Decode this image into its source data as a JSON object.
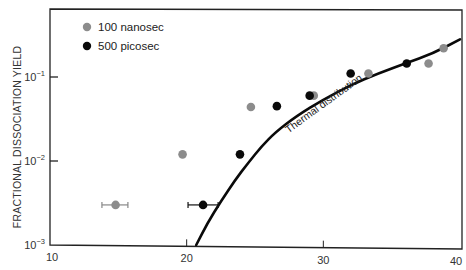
{
  "chart_data": {
    "type": "scatter",
    "title": "",
    "xlabel": "",
    "ylabel": "FRACTIONAL DISSOCIATION YIELD",
    "xlim": [
      10,
      40
    ],
    "ylim": [
      0.001,
      0.3
    ],
    "yscale": "log",
    "grid": false,
    "legend_position": "upper left",
    "x_ticks": [
      10,
      20,
      30,
      40
    ],
    "x_tick_labels": [
      "10",
      "20",
      "30",
      "40"
    ],
    "y_ticks": [
      0.001,
      0.01,
      0.1
    ],
    "y_tick_labels": [
      {
        "base": "10",
        "exp": "−3"
      },
      {
        "base": "10",
        "exp": "−2"
      },
      {
        "base": "10",
        "exp": "−1"
      }
    ],
    "series": [
      {
        "name": "100 nanosec",
        "color": "#8c8c8c",
        "marker": "circle",
        "points": [
          {
            "x": 14.8,
            "y": 0.003,
            "xerr": [
              13.8,
              15.7
            ]
          },
          {
            "x": 19.7,
            "y": 0.012
          },
          {
            "x": 24.7,
            "y": 0.044
          },
          {
            "x": 29.3,
            "y": 0.06
          },
          {
            "x": 33.3,
            "y": 0.11
          },
          {
            "x": 37.7,
            "y": 0.145
          },
          {
            "x": 38.8,
            "y": 0.22
          }
        ]
      },
      {
        "name": "500 picosec",
        "color": "#0a0a0a",
        "marker": "circle",
        "points": [
          {
            "x": 21.2,
            "y": 0.003,
            "xerr": [
              20.1,
              22.3
            ]
          },
          {
            "x": 23.9,
            "y": 0.012
          },
          {
            "x": 26.6,
            "y": 0.045
          },
          {
            "x": 29.0,
            "y": 0.06
          },
          {
            "x": 32.0,
            "y": 0.11
          },
          {
            "x": 36.1,
            "y": 0.145
          }
        ]
      }
    ],
    "curves": [
      {
        "name": "Thermal distribution",
        "color": "#0a0a0a",
        "points": [
          {
            "x": 20.7,
            "y": 0.001
          },
          {
            "x": 21.5,
            "y": 0.0018
          },
          {
            "x": 22.5,
            "y": 0.0033
          },
          {
            "x": 23.5,
            "y": 0.0058
          },
          {
            "x": 24.5,
            "y": 0.0095
          },
          {
            "x": 25.5,
            "y": 0.015
          },
          {
            "x": 26.5,
            "y": 0.022
          },
          {
            "x": 28.0,
            "y": 0.034
          },
          {
            "x": 30.0,
            "y": 0.054
          },
          {
            "x": 32.0,
            "y": 0.08
          },
          {
            "x": 34.0,
            "y": 0.11
          },
          {
            "x": 36.0,
            "y": 0.145
          },
          {
            "x": 38.0,
            "y": 0.19
          },
          {
            "x": 40.0,
            "y": 0.28
          }
        ]
      }
    ],
    "annotations": [
      {
        "text": "Thermal distribution",
        "x": 29.5,
        "y": 0.028,
        "rotation": -36
      }
    ]
  },
  "legend": {
    "items": [
      {
        "label": "100 nanosec",
        "color": "#8c8c8c"
      },
      {
        "label": "500 picosec",
        "color": "#0a0a0a"
      }
    ]
  },
  "labels": {
    "y_axis_title": "FRACTIONAL DISSOCIATION YIELD",
    "curve_label": "Thermal distribution"
  }
}
